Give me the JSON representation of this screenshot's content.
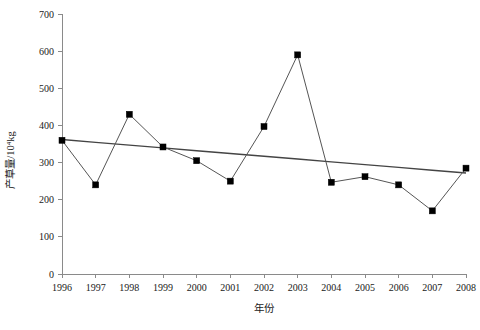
{
  "chart_data": {
    "type": "line",
    "title": "",
    "xlabel": "年份",
    "ylabel": "产草量/10⁴kg",
    "categories": [
      "1996",
      "1997",
      "1998",
      "1999",
      "2000",
      "2001",
      "2002",
      "2003",
      "2004",
      "2005",
      "2006",
      "2007",
      "2008"
    ],
    "x": [
      1996,
      1997,
      1998,
      1999,
      2000,
      2001,
      2002,
      2003,
      2004,
      2005,
      2006,
      2007,
      2008
    ],
    "values": [
      360,
      240,
      430,
      342,
      305,
      250,
      397,
      590,
      247,
      262,
      240,
      170,
      285
    ],
    "series": [
      {
        "name": "产草量",
        "marker": "square",
        "values": [
          360,
          240,
          430,
          342,
          305,
          250,
          397,
          590,
          247,
          262,
          240,
          170,
          285
        ]
      },
      {
        "name": "线性趋势线",
        "marker": "none",
        "values": [
          362,
          354.5,
          347,
          339.5,
          332,
          324.5,
          317,
          309.5,
          302,
          294.5,
          287,
          279.5,
          272
        ]
      }
    ],
    "ylim": [
      0,
      700
    ],
    "xlim": [
      1996,
      2008
    ],
    "yticks": [
      0,
      100,
      200,
      300,
      400,
      500,
      600,
      700
    ],
    "ytick_labels": [
      "0",
      "100",
      "200",
      "300",
      "400",
      "500",
      "600",
      "700"
    ],
    "xticks": [
      1996,
      1997,
      1998,
      1999,
      2000,
      2001,
      2002,
      2003,
      2004,
      2005,
      2006,
      2007,
      2008
    ],
    "xtick_labels": [
      "1996",
      "1997",
      "1998",
      "1999",
      "2000",
      "2001",
      "2002",
      "2003",
      "2004",
      "2005",
      "2006",
      "2007",
      "2008"
    ],
    "grid": false,
    "legend": null,
    "legend_position": "none",
    "annotations": [],
    "colors": {
      "series_line": "#555555",
      "trend_line": "#444444",
      "marker": "#000000",
      "axis": "#8a8a8a",
      "text": "#1a1a1a",
      "background": "#ffffff"
    }
  }
}
